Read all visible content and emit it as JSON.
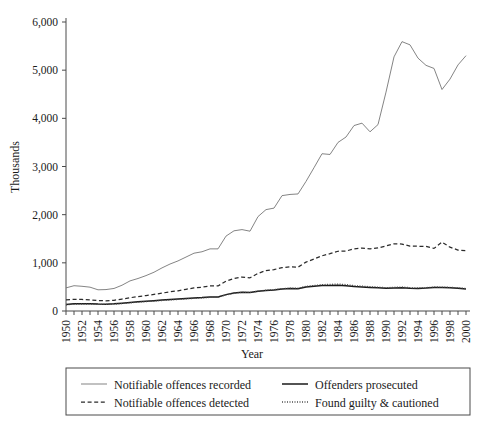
{
  "chart_data": {
    "type": "line",
    "title": "",
    "xlabel": "Year",
    "ylabel": "Thousands",
    "xlim": [
      1950,
      2000
    ],
    "ylim": [
      0,
      6000
    ],
    "grid": false,
    "legend_position": "bottom",
    "ytick_labels": [
      "0",
      "1,000",
      "2,000",
      "3,000",
      "4,000",
      "5,000",
      "6,000"
    ],
    "ytick_values": [
      0,
      1000,
      2000,
      3000,
      4000,
      5000,
      6000
    ],
    "xtick_labels": [
      "1950",
      "1952",
      "1954",
      "1956",
      "1958",
      "1960",
      "1962",
      "1964",
      "1966",
      "1968",
      "1970",
      "1972",
      "1974",
      "1976",
      "1978",
      "1980",
      "1982",
      "1984",
      "1986",
      "1988",
      "1990",
      "1992",
      "1994",
      "1996",
      "1998",
      "2000"
    ],
    "xtick_values": [
      1950,
      1952,
      1954,
      1956,
      1958,
      1960,
      1962,
      1964,
      1966,
      1968,
      1970,
      1972,
      1974,
      1976,
      1978,
      1980,
      1982,
      1984,
      1986,
      1988,
      1990,
      1992,
      1994,
      1996,
      1998,
      2000
    ],
    "x": [
      1950,
      1951,
      1952,
      1953,
      1954,
      1955,
      1956,
      1957,
      1958,
      1959,
      1960,
      1961,
      1962,
      1963,
      1964,
      1965,
      1966,
      1967,
      1968,
      1969,
      1970,
      1971,
      1972,
      1973,
      1974,
      1975,
      1976,
      1977,
      1978,
      1979,
      1980,
      1981,
      1982,
      1983,
      1984,
      1985,
      1986,
      1987,
      1988,
      1989,
      1990,
      1991,
      1992,
      1993,
      1994,
      1995,
      1996,
      1997,
      1998,
      1999,
      2000
    ],
    "series": [
      {
        "name": "Notifiable offences recorded",
        "style": "solid-thin",
        "color": "#6e6e6e",
        "values": [
          480,
          525,
          513,
          495,
          440,
          445,
          468,
          535,
          625,
          675,
          735,
          805,
          895,
          975,
          1040,
          1120,
          1200,
          1230,
          1290,
          1290,
          1555,
          1665,
          1690,
          1657,
          1960,
          2105,
          2136,
          2395,
          2420,
          2430,
          2690,
          2975,
          3265,
          3250,
          3500,
          3612,
          3850,
          3900,
          3720,
          3870,
          4544,
          5276,
          5592,
          5526,
          5250,
          5100,
          5036,
          4598,
          4815,
          5109,
          5301
        ]
      },
      {
        "name": "Notifiable offences detected",
        "style": "dashed",
        "color": "#2b2b2b",
        "values": [
          230,
          242,
          240,
          230,
          215,
          212,
          222,
          248,
          275,
          300,
          320,
          345,
          370,
          400,
          420,
          450,
          480,
          494,
          520,
          520,
          620,
          675,
          705,
          690,
          780,
          840,
          860,
          900,
          915,
          910,
          1015,
          1080,
          1145,
          1190,
          1240,
          1245,
          1290,
          1305,
          1290,
          1310,
          1350,
          1395,
          1390,
          1346,
          1345,
          1340,
          1300,
          1430,
          1325,
          1265,
          1255
        ]
      },
      {
        "name": "Offenders prosecuted",
        "style": "solid-thick",
        "color": "#1a1a1a",
        "values": [
          135,
          148,
          152,
          150,
          143,
          142,
          148,
          162,
          178,
          192,
          205,
          215,
          228,
          238,
          250,
          262,
          272,
          280,
          292,
          292,
          340,
          372,
          390,
          385,
          410,
          428,
          438,
          455,
          465,
          462,
          498,
          512,
          528,
          530,
          535,
          525,
          510,
          500,
          490,
          482,
          470,
          480,
          485,
          472,
          468,
          475,
          490,
          487,
          483,
          470,
          458
        ]
      },
      {
        "name": "Found guilty & cautioned",
        "style": "dotted",
        "color": "#4d4d4d",
        "values": [
          128,
          140,
          145,
          143,
          137,
          136,
          142,
          155,
          170,
          184,
          196,
          206,
          218,
          228,
          240,
          252,
          262,
          270,
          282,
          285,
          335,
          368,
          388,
          384,
          412,
          432,
          444,
          462,
          476,
          474,
          512,
          530,
          548,
          552,
          560,
          548,
          528,
          515,
          505,
          496,
          482,
          492,
          498,
          484,
          478,
          484,
          500,
          496,
          492,
          480,
          468
        ]
      }
    ]
  },
  "axes": {
    "ylabel": "Thousands",
    "xlabel": "Year"
  },
  "legend": {
    "entries": [
      {
        "label": "Notifiable offences recorded",
        "marker": "solid-thin-line-swatch"
      },
      {
        "label": "Offenders prosecuted",
        "marker": "solid-thick-line-swatch"
      },
      {
        "label": "Notifiable offences detected",
        "marker": "dashed-line-swatch"
      },
      {
        "label": "Found guilty & cautioned",
        "marker": "dotted-line-swatch"
      }
    ]
  },
  "colors": {
    "recorded": "#6e6e6e",
    "detected": "#2b2b2b",
    "prosecuted": "#1a1a1a",
    "guilty": "#4d4d4d",
    "axis": "#4a4a4a",
    "background": "#ffffff"
  }
}
